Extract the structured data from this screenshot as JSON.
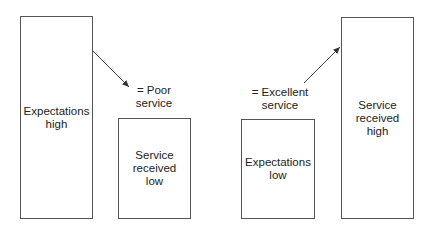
{
  "diagram": {
    "left_group": {
      "expectation_box": {
        "line1": "Expectations",
        "line2": "high"
      },
      "service_box": {
        "line1": "Service",
        "line2": "received",
        "line3": "low"
      },
      "result": {
        "line1": "= Poor",
        "line2": "service"
      }
    },
    "right_group": {
      "expectation_box": {
        "line1": "Expectations",
        "line2": "low"
      },
      "service_box": {
        "line1": "Service",
        "line2": "received",
        "line3": "high"
      },
      "result": {
        "line1": "= Excellent",
        "line2": "service"
      }
    },
    "colors": {
      "stroke": "#555555",
      "text": "#222222",
      "background": "#ffffff"
    }
  }
}
